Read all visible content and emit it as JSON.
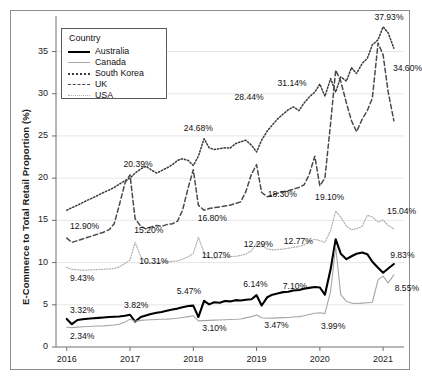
{
  "chart_data": {
    "type": "line",
    "title": "",
    "xlabel": "",
    "ylabel": "E-Commerce to Total Retail Proportion (%)",
    "ylim": [
      0,
      38.5
    ],
    "xlim": [
      2015.83,
      2021.33
    ],
    "grid": true,
    "gridlines_y": [
      5,
      10,
      15,
      20,
      25,
      30,
      35
    ],
    "yticks": [
      "0",
      "5",
      "10",
      "15",
      "20",
      "25",
      "30",
      "35"
    ],
    "ytick_values": [
      0,
      5,
      10,
      15,
      20,
      25,
      30,
      35
    ],
    "xticks": [
      "2016",
      "2017",
      "2018",
      "2019",
      "2020",
      "2021"
    ],
    "xtick_values": [
      2016,
      2017,
      2018,
      2019,
      2020,
      2021
    ],
    "legend": {
      "title": "Country",
      "position": "upper-left-inside",
      "entries": [
        {
          "label": "Australia",
          "style": "solid-thick-black",
          "color": "#000000"
        },
        {
          "label": "Canada",
          "style": "solid-thin-gray",
          "color": "#a6a6a6"
        },
        {
          "label": "South Korea",
          "style": "dotted",
          "color": "#3b3b3b"
        },
        {
          "label": "UK",
          "style": "dashed",
          "color": "#4a4a4a"
        },
        {
          "label": "USA",
          "style": "fine-dotted",
          "color": "#b0b0b0"
        }
      ]
    },
    "annotations": [
      {
        "text": "12.90%",
        "series": "UK",
        "x": 2016.02,
        "y": 12.9
      },
      {
        "text": "9.43%",
        "series": "USA",
        "x": 2016.02,
        "y": 9.43
      },
      {
        "text": "3.32%",
        "series": "Australia",
        "x": 2016.02,
        "y": 3.32
      },
      {
        "text": "2.34%",
        "series": "Canada",
        "x": 2016.02,
        "y": 2.34
      },
      {
        "text": "20.39%",
        "series": "UK",
        "x": 2016.96,
        "y": 20.39
      },
      {
        "text": "15.20%",
        "series": "UK",
        "x": 2017.1,
        "y": 15.2
      },
      {
        "text": "10.31%",
        "series": "USA",
        "x": 2017.02,
        "y": 10.31
      },
      {
        "text": "3.82%",
        "series": "Australia",
        "x": 2017.0,
        "y": 3.82
      },
      {
        "text": "24.68%",
        "series": "South Korea",
        "x": 2018.04,
        "y": 24.68
      },
      {
        "text": "16.80%",
        "series": "UK",
        "x": 2018.1,
        "y": 16.8
      },
      {
        "text": "11.07%",
        "series": "USA",
        "x": 2018.04,
        "y": 11.07
      },
      {
        "text": "5.47%",
        "series": "Australia",
        "x": 2017.96,
        "y": 5.47
      },
      {
        "text": "3.10%",
        "series": "Canada",
        "x": 2018.08,
        "y": 3.1
      },
      {
        "text": "28.44%",
        "series": "South Korea",
        "x": 2019.0,
        "y": 28.44
      },
      {
        "text": "18.30%",
        "series": "UK",
        "x": 2019.08,
        "y": 18.3
      },
      {
        "text": "12.29%",
        "series": "USA",
        "x": 2019.02,
        "y": 12.29
      },
      {
        "text": "6.14%",
        "series": "Australia",
        "x": 2018.98,
        "y": 6.14
      },
      {
        "text": "3.47%",
        "series": "Canada",
        "x": 2019.06,
        "y": 3.47
      },
      {
        "text": "31.14%",
        "series": "South Korea",
        "x": 2019.9,
        "y": 31.14
      },
      {
        "text": "19.10%",
        "series": "UK",
        "x": 2020.02,
        "y": 19.1
      },
      {
        "text": "12.77%",
        "series": "USA",
        "x": 2020.0,
        "y": 12.77
      },
      {
        "text": "7.10%",
        "series": "Australia",
        "x": 2019.92,
        "y": 7.1
      },
      {
        "text": "3.99%",
        "series": "Canada",
        "x": 2020.08,
        "y": 3.99
      },
      {
        "text": "37.93%",
        "series": "South Korea",
        "x": 2021.02,
        "y": 37.93
      },
      {
        "text": "34.60%",
        "series": "UK",
        "x": 2021.06,
        "y": 34.6
      },
      {
        "text": "15.04%",
        "series": "USA",
        "x": 2021.0,
        "y": 15.04
      },
      {
        "text": "9.83%",
        "series": "Australia",
        "x": 2021.08,
        "y": 9.83
      },
      {
        "text": "8.55%",
        "series": "Canada",
        "x": 2021.12,
        "y": 8.55
      }
    ],
    "series": [
      {
        "name": "Australia",
        "color": "#000000",
        "style": "solid-thick-black",
        "x": [
          2016.0,
          2016.08,
          2016.17,
          2016.25,
          2016.33,
          2016.42,
          2016.5,
          2016.58,
          2016.67,
          2016.75,
          2016.83,
          2016.92,
          2017.0,
          2017.08,
          2017.17,
          2017.25,
          2017.33,
          2017.42,
          2017.5,
          2017.58,
          2017.67,
          2017.75,
          2017.83,
          2017.92,
          2018.0,
          2018.08,
          2018.17,
          2018.25,
          2018.33,
          2018.42,
          2018.5,
          2018.58,
          2018.67,
          2018.75,
          2018.83,
          2018.92,
          2019.0,
          2019.08,
          2019.17,
          2019.25,
          2019.33,
          2019.42,
          2019.5,
          2019.58,
          2019.67,
          2019.75,
          2019.83,
          2019.92,
          2020.0,
          2020.08,
          2020.17,
          2020.25,
          2020.33,
          2020.42,
          2020.5,
          2020.58,
          2020.67,
          2020.75,
          2020.83,
          2020.92,
          2021.0,
          2021.08,
          2021.17
        ],
        "y": [
          3.32,
          2.7,
          3.2,
          3.28,
          3.35,
          3.4,
          3.45,
          3.5,
          3.55,
          3.58,
          3.62,
          3.7,
          3.82,
          3.0,
          3.55,
          3.72,
          3.9,
          4.05,
          4.15,
          4.3,
          4.45,
          4.55,
          4.72,
          4.85,
          4.9,
          3.55,
          5.47,
          5.05,
          5.3,
          5.25,
          5.45,
          5.4,
          5.55,
          5.5,
          5.6,
          5.65,
          6.14,
          4.92,
          5.9,
          6.2,
          6.35,
          6.5,
          6.55,
          6.7,
          6.75,
          6.9,
          7.0,
          7.1,
          7.05,
          6.2,
          9.2,
          12.77,
          11.05,
          10.4,
          10.75,
          11.05,
          11.2,
          11.0,
          10.1,
          9.4,
          8.8,
          9.3,
          9.83
        ]
      },
      {
        "name": "Canada",
        "color": "#a6a6a6",
        "style": "solid-thin-gray",
        "x": [
          2016.0,
          2016.08,
          2016.17,
          2016.25,
          2016.33,
          2016.42,
          2016.5,
          2016.58,
          2016.67,
          2016.75,
          2016.83,
          2016.92,
          2017.0,
          2017.08,
          2017.17,
          2017.25,
          2017.33,
          2017.42,
          2017.5,
          2017.58,
          2017.67,
          2017.75,
          2017.83,
          2017.92,
          2018.0,
          2018.08,
          2018.17,
          2018.25,
          2018.33,
          2018.42,
          2018.5,
          2018.58,
          2018.67,
          2018.75,
          2018.83,
          2018.92,
          2019.0,
          2019.08,
          2019.17,
          2019.25,
          2019.33,
          2019.42,
          2019.5,
          2019.58,
          2019.67,
          2019.75,
          2019.83,
          2019.92,
          2020.0,
          2020.08,
          2020.17,
          2020.25,
          2020.33,
          2020.42,
          2020.5,
          2020.58,
          2020.67,
          2020.75,
          2020.83,
          2020.92,
          2021.0,
          2021.08,
          2021.17
        ],
        "y": [
          2.34,
          2.3,
          2.35,
          2.4,
          2.42,
          2.45,
          2.48,
          2.5,
          2.55,
          2.6,
          2.7,
          2.95,
          3.3,
          3.05,
          3.15,
          3.2,
          3.22,
          3.25,
          3.28,
          3.3,
          3.35,
          3.4,
          3.5,
          3.6,
          3.7,
          3.1,
          3.12,
          3.15,
          3.18,
          3.2,
          3.22,
          3.25,
          3.28,
          3.32,
          3.45,
          3.6,
          3.8,
          3.47,
          3.4,
          3.42,
          3.45,
          3.48,
          3.5,
          3.55,
          3.6,
          3.7,
          3.85,
          3.99,
          4.05,
          3.95,
          6.6,
          11.9,
          6.2,
          5.4,
          5.2,
          5.15,
          5.2,
          5.25,
          5.3,
          7.95,
          8.4,
          7.6,
          8.55
        ]
      },
      {
        "name": "South Korea",
        "color": "#3b3b3b",
        "style": "dotted",
        "x": [
          2016.0,
          2016.08,
          2016.17,
          2016.25,
          2016.33,
          2016.42,
          2016.5,
          2016.58,
          2016.67,
          2016.75,
          2016.83,
          2016.92,
          2017.0,
          2017.08,
          2017.17,
          2017.25,
          2017.33,
          2017.42,
          2017.5,
          2017.58,
          2017.67,
          2017.75,
          2017.83,
          2017.92,
          2018.0,
          2018.08,
          2018.17,
          2018.25,
          2018.33,
          2018.42,
          2018.5,
          2018.58,
          2018.67,
          2018.75,
          2018.83,
          2018.92,
          2019.0,
          2019.08,
          2019.17,
          2019.25,
          2019.33,
          2019.42,
          2019.5,
          2019.58,
          2019.67,
          2019.75,
          2019.83,
          2019.92,
          2020.0,
          2020.08,
          2020.17,
          2020.25,
          2020.33,
          2020.42,
          2020.5,
          2020.58,
          2020.67,
          2020.75,
          2020.83,
          2020.92,
          2021.0,
          2021.08,
          2021.17
        ],
        "y": [
          16.2,
          16.5,
          16.8,
          17.1,
          17.4,
          17.7,
          18.0,
          18.3,
          18.6,
          18.9,
          19.3,
          19.7,
          20.0,
          20.6,
          21.1,
          21.4,
          21.0,
          20.6,
          20.9,
          21.2,
          21.6,
          22.1,
          22.3,
          22.1,
          21.5,
          22.6,
          24.68,
          23.6,
          23.4,
          23.5,
          23.6,
          23.55,
          24.1,
          24.3,
          24.5,
          23.9,
          23.1,
          24.5,
          25.6,
          26.3,
          27.0,
          27.6,
          28.1,
          28.44,
          28.0,
          28.9,
          29.6,
          30.2,
          31.14,
          29.7,
          31.8,
          30.2,
          32.0,
          31.5,
          33.1,
          32.4,
          33.6,
          34.2,
          35.8,
          36.4,
          37.93,
          37.2,
          35.4
        ]
      },
      {
        "name": "UK",
        "color": "#4a4a4a",
        "style": "dashed",
        "x": [
          2016.0,
          2016.08,
          2016.17,
          2016.25,
          2016.33,
          2016.42,
          2016.5,
          2016.58,
          2016.67,
          2016.75,
          2016.83,
          2016.92,
          2017.0,
          2017.08,
          2017.17,
          2017.25,
          2017.33,
          2017.42,
          2017.5,
          2017.58,
          2017.67,
          2017.75,
          2017.83,
          2017.92,
          2018.0,
          2018.08,
          2018.17,
          2018.25,
          2018.33,
          2018.42,
          2018.5,
          2018.58,
          2018.67,
          2018.75,
          2018.83,
          2018.92,
          2019.0,
          2019.08,
          2019.17,
          2019.25,
          2019.33,
          2019.42,
          2019.5,
          2019.58,
          2019.67,
          2019.75,
          2019.83,
          2019.92,
          2020.0,
          2020.08,
          2020.17,
          2020.25,
          2020.33,
          2020.42,
          2020.5,
          2020.58,
          2020.67,
          2020.75,
          2020.83,
          2020.92,
          2021.0,
          2021.08,
          2021.17
        ],
        "y": [
          12.9,
          12.4,
          12.6,
          12.8,
          13.0,
          13.2,
          13.4,
          13.6,
          13.9,
          14.6,
          16.8,
          19.4,
          20.39,
          15.2,
          14.3,
          14.0,
          14.2,
          14.4,
          14.3,
          14.5,
          14.6,
          14.9,
          16.2,
          18.9,
          21.0,
          16.8,
          16.2,
          16.4,
          16.5,
          16.6,
          16.7,
          16.8,
          17.0,
          17.2,
          18.4,
          20.5,
          21.6,
          18.3,
          17.8,
          18.0,
          18.2,
          18.4,
          18.5,
          18.7,
          18.9,
          19.2,
          20.4,
          22.6,
          19.1,
          20.0,
          26.5,
          32.8,
          31.5,
          28.9,
          26.8,
          25.5,
          27.0,
          28.0,
          29.5,
          36.0,
          34.6,
          30.2,
          26.8
        ]
      },
      {
        "name": "USA",
        "color": "#b0b0b0",
        "style": "fine-dotted",
        "x": [
          2016.0,
          2016.08,
          2016.17,
          2016.25,
          2016.33,
          2016.42,
          2016.5,
          2016.58,
          2016.67,
          2016.75,
          2016.83,
          2016.92,
          2017.0,
          2017.08,
          2017.17,
          2017.25,
          2017.33,
          2017.42,
          2017.5,
          2017.58,
          2017.67,
          2017.75,
          2017.83,
          2017.92,
          2018.0,
          2018.08,
          2018.17,
          2018.25,
          2018.33,
          2018.42,
          2018.5,
          2018.58,
          2018.67,
          2018.75,
          2018.83,
          2018.92,
          2019.0,
          2019.08,
          2019.17,
          2019.25,
          2019.33,
          2019.42,
          2019.5,
          2019.58,
          2019.67,
          2019.75,
          2019.83,
          2019.92,
          2020.0,
          2020.08,
          2020.17,
          2020.25,
          2020.33,
          2020.42,
          2020.5,
          2020.58,
          2020.67,
          2020.75,
          2020.83,
          2020.92,
          2021.0,
          2021.08,
          2021.17
        ],
        "y": [
          9.43,
          9.2,
          9.15,
          9.1,
          9.12,
          9.15,
          9.18,
          9.2,
          9.25,
          9.3,
          9.5,
          9.9,
          10.31,
          12.4,
          10.7,
          10.0,
          9.95,
          10.0,
          10.05,
          10.1,
          10.15,
          10.2,
          10.4,
          10.7,
          11.07,
          13.0,
          11.2,
          10.6,
          10.55,
          10.6,
          10.65,
          10.7,
          10.75,
          10.85,
          11.0,
          11.4,
          12.29,
          12.1,
          11.6,
          11.5,
          11.55,
          11.6,
          11.7,
          11.8,
          11.9,
          12.1,
          12.5,
          12.77,
          12.6,
          12.4,
          13.8,
          16.1,
          15.4,
          14.3,
          13.9,
          14.0,
          14.3,
          15.6,
          15.4,
          14.8,
          15.04,
          14.4,
          14.0
        ]
      }
    ]
  }
}
